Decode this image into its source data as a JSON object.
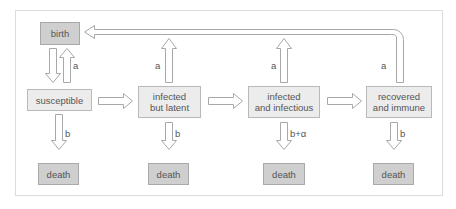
{
  "diagram": {
    "type": "compartmental-epidemic-model",
    "nodes": {
      "birth": "birth",
      "susceptible": "susceptible",
      "latent_line1": "infected",
      "latent_line2": "but latent",
      "infectious_line1": "infected",
      "infectious_line2": "and infectious",
      "recovered_line1": "recovered",
      "recovered_line2": "and immune",
      "death1": "death",
      "death2": "death",
      "death3": "death",
      "death4": "death"
    },
    "edge_labels": {
      "birth_from_susceptible": "a",
      "birth_from_latent": "a",
      "birth_from_infectious": "a",
      "birth_from_recovered": "a",
      "death_susceptible": "b",
      "death_latent": "b",
      "death_infectious": "b+α",
      "death_recovered": "b"
    },
    "edges": [
      {
        "from": "birth",
        "to": "susceptible",
        "label": ""
      },
      {
        "from": "susceptible",
        "to": "birth",
        "label": "a"
      },
      {
        "from": "susceptible",
        "to": "infected but latent",
        "label": ""
      },
      {
        "from": "infected but latent",
        "to": "infected and infectious",
        "label": ""
      },
      {
        "from": "infected and infectious",
        "to": "recovered and immune",
        "label": ""
      },
      {
        "from": "infected but latent",
        "to": "birth",
        "label": "a"
      },
      {
        "from": "infected and infectious",
        "to": "birth",
        "label": "a"
      },
      {
        "from": "recovered and immune",
        "to": "birth",
        "label": "a"
      },
      {
        "from": "susceptible",
        "to": "death",
        "label": "b"
      },
      {
        "from": "infected but latent",
        "to": "death",
        "label": "b"
      },
      {
        "from": "infected and infectious",
        "to": "death",
        "label": "b+α"
      },
      {
        "from": "recovered and immune",
        "to": "death",
        "label": "b"
      }
    ],
    "colors": {
      "dark_box": "#cfcfcf",
      "light_box": "#ececec",
      "arrow_stroke": "#a8a8a8",
      "frame": "#dcdcdc"
    }
  }
}
